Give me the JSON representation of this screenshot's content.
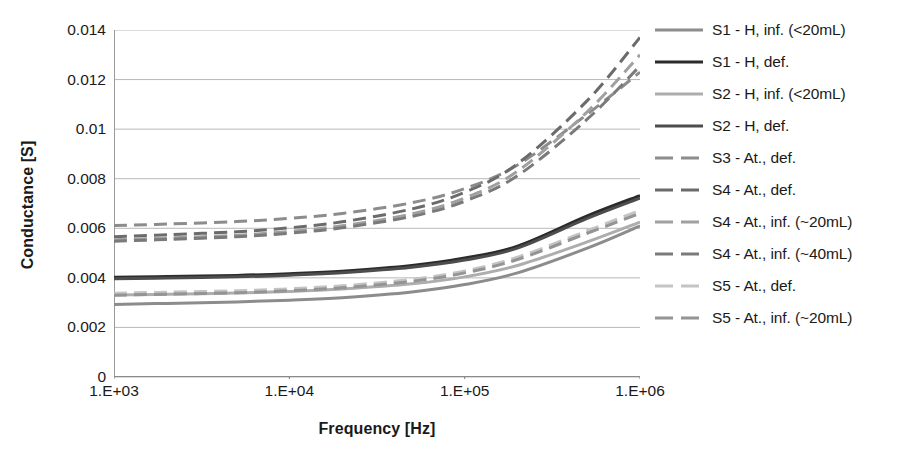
{
  "chart_data": {
    "type": "line",
    "title": "",
    "xlabel": "Frequency [Hz]",
    "ylabel": "Conductance [S]",
    "xscale": "log",
    "xlim": [
      1000,
      1000000
    ],
    "ylim": [
      0,
      0.014
    ],
    "grid": "horizontal",
    "legend_position": "right",
    "xticklabels": [
      "1.E+03",
      "1.E+04",
      "1.E+05",
      "1.E+06"
    ],
    "xtickvalues": [
      1000,
      10000,
      100000,
      1000000
    ],
    "yticklabels": [
      "0",
      "0.002",
      "0.004",
      "0.006",
      "0.008",
      "0.01",
      "0.012",
      "0.014"
    ],
    "ytickvalues": [
      0,
      0.002,
      0.004,
      0.006,
      0.008,
      0.01,
      0.012,
      0.014
    ],
    "x": [
      1000,
      2000,
      5000,
      10000,
      20000,
      50000,
      100000,
      200000,
      500000,
      1000000
    ],
    "series": [
      {
        "name": "S1 - H, inf. (<20mL)",
        "style": "solid",
        "color": "#8c8c8c",
        "width": 3,
        "values": [
          0.00293,
          0.00297,
          0.00303,
          0.0031,
          0.0032,
          0.00343,
          0.00373,
          0.0042,
          0.0052,
          0.0061
        ]
      },
      {
        "name": "S1 - H, def.",
        "style": "solid",
        "color": "#2b2b2b",
        "width": 3,
        "values": [
          0.00402,
          0.00405,
          0.0041,
          0.00417,
          0.00427,
          0.0045,
          0.0048,
          0.00528,
          0.0065,
          0.00732
        ]
      },
      {
        "name": "S2 - H, inf. (<20mL)",
        "style": "solid",
        "color": "#adadad",
        "width": 3,
        "values": [
          0.00331,
          0.00334,
          0.00339,
          0.00345,
          0.00355,
          0.00376,
          0.00404,
          0.0045,
          0.00545,
          0.00625
        ]
      },
      {
        "name": "S2 - H, def.",
        "style": "solid",
        "color": "#4d4d4d",
        "width": 3,
        "values": [
          0.00396,
          0.00399,
          0.00404,
          0.00411,
          0.00421,
          0.00443,
          0.00472,
          0.0052,
          0.0064,
          0.00722
        ]
      },
      {
        "name": "S3 - At., def.",
        "style": "dashed",
        "color": "#8c8c8c",
        "width": 3,
        "values": [
          0.00611,
          0.00617,
          0.00627,
          0.0064,
          0.0066,
          0.00703,
          0.0076,
          0.00855,
          0.0106,
          0.0123
        ]
      },
      {
        "name": "S4 - At., def.",
        "style": "dashed",
        "color": "#6b6b6b",
        "width": 3,
        "values": [
          0.00566,
          0.00574,
          0.00586,
          0.00602,
          0.00626,
          0.00678,
          0.00745,
          0.0086,
          0.01115,
          0.0137
        ]
      },
      {
        "name": "S4 - At., inf. (~20mL)",
        "style": "dashed",
        "color": "#a0a0a0",
        "width": 3,
        "values": [
          0.00554,
          0.00561,
          0.00572,
          0.00587,
          0.0061,
          0.00658,
          0.00722,
          0.0083,
          0.0107,
          0.013
        ]
      },
      {
        "name": "S4 - At., inf. (~40mL)",
        "style": "dashed",
        "color": "#7a7a7a",
        "width": 3,
        "values": [
          0.00548,
          0.00555,
          0.00566,
          0.0058,
          0.00602,
          0.00648,
          0.00709,
          0.00812,
          0.0104,
          0.01255
        ]
      },
      {
        "name": "S5 - At., def.",
        "style": "dashed",
        "color": "#c4c4c4",
        "width": 3,
        "values": [
          0.00338,
          0.00342,
          0.00348,
          0.00356,
          0.00368,
          0.00394,
          0.00428,
          0.00483,
          0.0059,
          0.00672
        ]
      },
      {
        "name": "S5 - At., inf. (~20mL)",
        "style": "dashed",
        "color": "#949494",
        "width": 3,
        "values": [
          0.0033,
          0.00334,
          0.0034,
          0.00348,
          0.0036,
          0.00386,
          0.0042,
          0.00474,
          0.0058,
          0.0066
        ]
      }
    ]
  }
}
